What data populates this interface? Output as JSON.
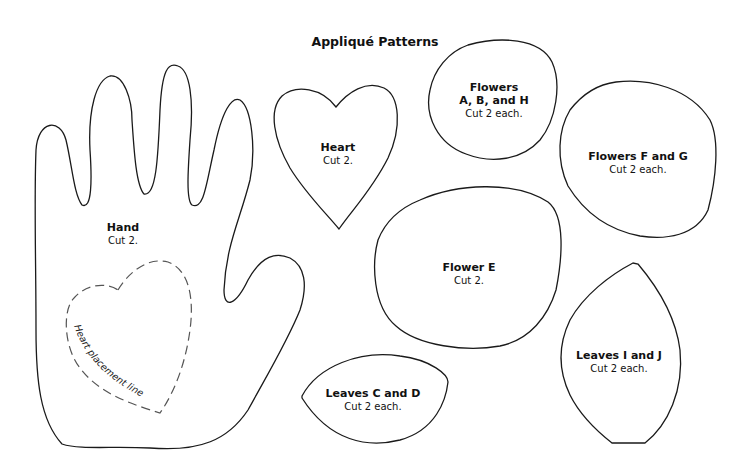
{
  "title": "Appliqué Patterns",
  "patterns": [
    {
      "id": "hand",
      "name": "Hand",
      "instruction": "Cut 2."
    },
    {
      "id": "heart",
      "name": "Heart",
      "instruction": "Cut 2."
    },
    {
      "id": "flowers-abh",
      "name_line1": "Flowers",
      "name_line2": "A, B, and H",
      "instruction": "Cut 2 each."
    },
    {
      "id": "flowers-fg",
      "name": "Flowers F and G",
      "instruction": "Cut 2 each."
    },
    {
      "id": "flower-e",
      "name": "Flower E",
      "instruction": "Cut 2."
    },
    {
      "id": "leaves-ij",
      "name": "Leaves I and J",
      "instruction": "Cut 2 each."
    },
    {
      "id": "leaves-cd",
      "name": "Leaves C and D",
      "instruction": "Cut 2 each."
    }
  ],
  "heart_placement_label": "Heart placement line",
  "colors": {
    "outline": "#1a1a1a",
    "dashed": "#555555",
    "background": "#ffffff"
  }
}
